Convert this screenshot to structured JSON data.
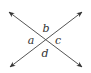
{
  "diagram": {
    "type": "intersecting-lines",
    "intersection": {
      "x": 46,
      "y": 40
    },
    "line_color": "#555555",
    "lines": [
      {
        "name": "line-1",
        "from": {
          "x": 9,
          "y": 12
        },
        "to": {
          "x": 82,
          "y": 67
        }
      },
      {
        "name": "line-2",
        "from": {
          "x": 10,
          "y": 67
        },
        "to": {
          "x": 82,
          "y": 12
        }
      }
    ],
    "angle_labels": [
      {
        "label": "a",
        "x": 31,
        "y": 44
      },
      {
        "label": "b",
        "x": 46,
        "y": 32
      },
      {
        "label": "c",
        "x": 58,
        "y": 44
      },
      {
        "label": "d",
        "x": 45,
        "y": 57
      }
    ]
  }
}
